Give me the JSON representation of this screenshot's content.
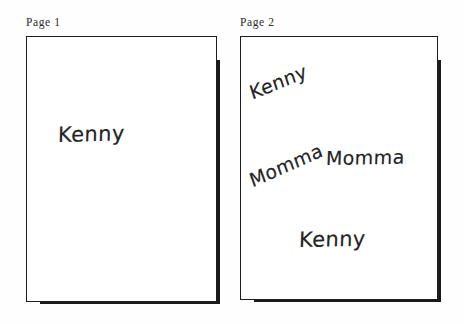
{
  "figure": {
    "background_color": "#fefefe",
    "ink_color": "#242424",
    "outline_color": "#1d1d1d",
    "shadow_color": "#1a1a1a"
  },
  "pages": [
    {
      "label": "Page 1",
      "handwriting": [
        {
          "text": "Kenny",
          "rotation_deg": -1.5
        }
      ]
    },
    {
      "label": "Page 2",
      "handwriting": [
        {
          "text": "Kenny",
          "rotation_deg": -22
        },
        {
          "text": "Momma",
          "rotation_deg": -24
        },
        {
          "text": "Momma",
          "rotation_deg": -1
        },
        {
          "text": "Kenny",
          "rotation_deg": -1
        }
      ]
    }
  ]
}
